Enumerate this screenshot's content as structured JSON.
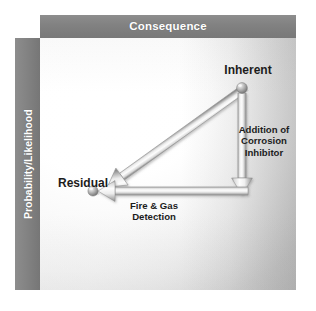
{
  "figure": {
    "canvas_width": 316,
    "canvas_height": 311,
    "background_color": "#ffffff"
  },
  "axes": {
    "x_axis": {
      "label": "Consequence",
      "bar_color": "#828282",
      "text_color": "#ffffff",
      "position": "top"
    },
    "y_axis": {
      "label": "Probability/Likelihood",
      "bar_color": "#828282",
      "text_color": "#ffffff",
      "position": "left",
      "orientation": "vertical"
    }
  },
  "plot": {
    "gradient_from": "#fafafa",
    "gradient_to": "#c4c4c4"
  },
  "nodes": [
    {
      "id": "inherent",
      "label": "Inherent",
      "x": 202,
      "y": 50,
      "marker": "sphere",
      "marker_color": "#9a9a9a"
    },
    {
      "id": "residual",
      "label": "Residual",
      "x": 53,
      "y": 153,
      "marker": "sphere",
      "marker_color": "#9a9a9a"
    }
  ],
  "arrows": [
    {
      "id": "risk-reduction",
      "label": "",
      "from": "inherent",
      "to": "residual",
      "direction": "diagonal-down-left",
      "color": "#b5b5b5"
    },
    {
      "id": "corrosion-inhibitor",
      "label": "Addition of\nCorrosion\nInhibitor",
      "direction": "down",
      "color": "#b5b5b5"
    },
    {
      "id": "fire-gas-detection",
      "label": "Fire & Gas\nDetection",
      "direction": "left",
      "color": "#b5b5b5"
    }
  ],
  "labels": {
    "inherent": "Inherent",
    "residual": "Residual",
    "corrosion_inhibitor": "Addition of\nCorrosion\nInhibitor",
    "fire_gas_detection": "Fire & Gas\nDetection"
  }
}
